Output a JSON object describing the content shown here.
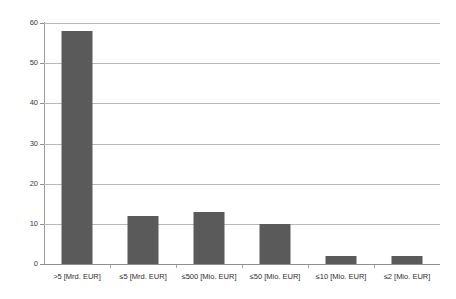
{
  "chart_data": {
    "type": "bar",
    "title": "",
    "xlabel": "",
    "ylabel": "",
    "categories": [
      ">5 [Mrd. EUR]",
      "≤5 [Mrd. EUR]",
      "≤500 [Mio. EUR]",
      "≤50 [Mio. EUR]",
      "≤10 [Mio. EUR]",
      "≤2 [Mio. EUR]"
    ],
    "values": [
      58,
      12,
      13,
      10,
      2,
      2
    ],
    "ylim": [
      0,
      60
    ],
    "ytick_labels": [
      "0",
      "10",
      "20",
      "30",
      "40",
      "50",
      "60"
    ],
    "ytick_values": [
      0,
      10,
      20,
      30,
      40,
      50,
      60
    ],
    "grid": true,
    "legend": "none",
    "bar_color": "#5a5a5a",
    "gridline_color": "#b9b9b9",
    "axis_color": "#8f8f8f",
    "background_color": "#ffffff"
  }
}
